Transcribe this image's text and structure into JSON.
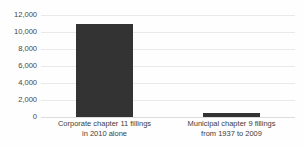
{
  "chart_data": {
    "type": "bar",
    "title": "",
    "subtitle": "",
    "xlabel": "",
    "ylabel": "",
    "categories": [
      "Corporate chapter 11 fillings in 2010 alone",
      "Municipal chapter 9 fillings from 1937 to 2009"
    ],
    "category_lines": [
      [
        "Corporate chapter 11 fillings",
        "in 2010 alone"
      ],
      [
        "Municipal chapter 9 fillings",
        "from 1937 to 2009"
      ]
    ],
    "values": [
      11000,
      500
    ],
    "ylim": [
      0,
      12000
    ],
    "ytick_step": 2000,
    "ytick_labels": [
      "12,000",
      "10,000",
      "8,000",
      "6,000",
      "4,000",
      "2,000",
      "0"
    ],
    "ytick_values": [
      12000,
      10000,
      8000,
      6000,
      4000,
      2000,
      0
    ],
    "grid": true,
    "grid_axis": "y",
    "legend": false,
    "legend_position": "none",
    "bar_color": "#333333",
    "grid_color": "#e9e9e9",
    "background_color": "#fefefe",
    "text_color": "#3d3d3d"
  },
  "footer": {
    "remnant_text": ""
  }
}
